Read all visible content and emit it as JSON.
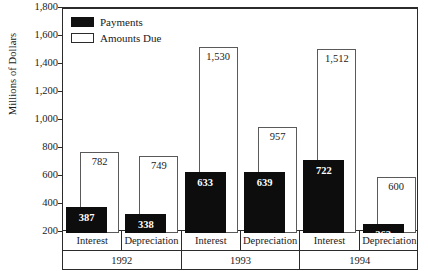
{
  "chart_data": {
    "type": "bar",
    "title": "",
    "xlabel": "",
    "ylabel": "Millions of Dollars",
    "ylim": [
      200,
      1800
    ],
    "ytick_labels": [
      "1,800",
      "1,600",
      "1,400",
      "1,200",
      "1,000",
      "800",
      "600",
      "400",
      "200"
    ],
    "ytick_values": [
      1800,
      1600,
      1400,
      1200,
      1000,
      800,
      600,
      400,
      200
    ],
    "grid": false,
    "legend_position": "top-left",
    "categories": [
      "Interest",
      "Depreciation",
      "Interest",
      "Depreciation",
      "Interest",
      "Depreciation"
    ],
    "groups": [
      "1992",
      "1993",
      "1994"
    ],
    "series": [
      {
        "name": "Payments",
        "color": "#0d0d0d",
        "style": "filled",
        "values": [
          387,
          338,
          633,
          639,
          722,
          262
        ],
        "labels": [
          "387",
          "338",
          "633",
          "639",
          "722",
          "262"
        ]
      },
      {
        "name": "Amounts Due",
        "color": "#ffffff",
        "style": "hollow",
        "values": [
          782,
          749,
          1530,
          957,
          1512,
          600
        ],
        "labels": [
          "782",
          "749",
          "1,530",
          "957",
          "1,512",
          "600"
        ]
      }
    ]
  },
  "axis": {
    "y_title": "Millions of Dollars",
    "y_ticks": [
      "1,800",
      "1,600",
      "1,400",
      "1,200",
      "1,000",
      "800",
      "600",
      "400",
      "200"
    ]
  },
  "legend": {
    "items": [
      {
        "label": "Payments",
        "style": "filled"
      },
      {
        "label": "Amounts Due",
        "style": "hollow"
      }
    ]
  },
  "bottom_labels": {
    "categories": [
      "Interest",
      "Depreciation",
      "Interest",
      "Depreciation",
      "Interest",
      "Depreciation"
    ],
    "years": [
      "1992",
      "1993",
      "1994"
    ]
  },
  "bar_labels": {
    "due": [
      "782",
      "749",
      "1,530",
      "957",
      "1,512",
      "600"
    ],
    "pay": [
      "387",
      "338",
      "633",
      "639",
      "722",
      "262"
    ]
  }
}
